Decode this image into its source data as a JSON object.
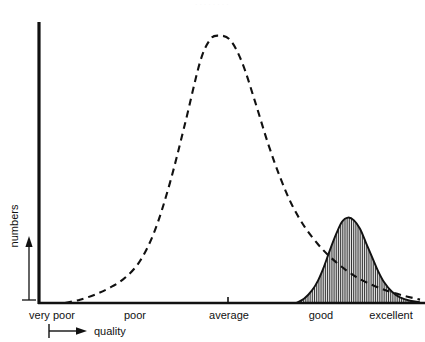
{
  "figure": {
    "faint_top_mark": "· · · · · · · ·",
    "axes": {
      "x_axis_name": "quality",
      "y_axis_name": "numbers",
      "x_tick_labels": [
        "very poor",
        "poor",
        "average",
        "good",
        "excellent"
      ],
      "y_tick_labels": [],
      "line_color": "#111111",
      "background_color": "#ffffff"
    },
    "series_names": {
      "dashed": "dashed-distribution-curve",
      "solid": "solid-hatched-distribution-curve"
    }
  },
  "chart_data": {
    "type": "line",
    "title": "",
    "subtitle": "",
    "xlabel": "quality",
    "ylabel": "numbers",
    "grid": false,
    "legend_position": "none",
    "categories": [
      "very poor",
      "poor",
      "average",
      "good",
      "excellent"
    ],
    "category_x": [
      52,
      135,
      228,
      320,
      390
    ],
    "xlim": [
      38,
      425
    ],
    "ylim": [
      0,
      1
    ],
    "x_axis_tick_marks": [
      228
    ],
    "annotations": [
      {
        "text": "quality",
        "type": "axis-arrow-label",
        "x": 95,
        "y": 330
      },
      {
        "text": "numbers",
        "type": "axis-arrow-label",
        "x": 14,
        "y": 225
      }
    ],
    "series": [
      {
        "name": "dashed-distribution-curve",
        "style": "dashed",
        "fill": "none",
        "peak_category": "average",
        "peak_x": 218,
        "peak_height": 0.955,
        "x": [
          65,
          80,
          95,
          110,
          125,
          140,
          155,
          170,
          185,
          200,
          210,
          218,
          230,
          242,
          255,
          268,
          280,
          292,
          305,
          318,
          330,
          345,
          360,
          375,
          390,
          405,
          420
        ],
        "values": [
          0.0,
          0.012,
          0.03,
          0.055,
          0.09,
          0.15,
          0.26,
          0.43,
          0.64,
          0.86,
          0.94,
          0.955,
          0.94,
          0.86,
          0.72,
          0.57,
          0.45,
          0.35,
          0.27,
          0.21,
          0.165,
          0.12,
          0.085,
          0.06,
          0.04,
          0.025,
          0.012
        ]
      },
      {
        "name": "solid-hatched-distribution-curve",
        "style": "solid",
        "fill": "vertical-hatch",
        "peak_category": "between good and excellent",
        "peak_x": 348,
        "peak_height": 0.305,
        "x": [
          296,
          304,
          312,
          318,
          324,
          330,
          336,
          342,
          348,
          354,
          360,
          366,
          372,
          378,
          384,
          392,
          400,
          410,
          420
        ],
        "values": [
          0.0,
          0.015,
          0.045,
          0.08,
          0.13,
          0.19,
          0.245,
          0.29,
          0.305,
          0.295,
          0.265,
          0.215,
          0.165,
          0.115,
          0.075,
          0.04,
          0.02,
          0.008,
          0.003
        ]
      }
    ]
  }
}
